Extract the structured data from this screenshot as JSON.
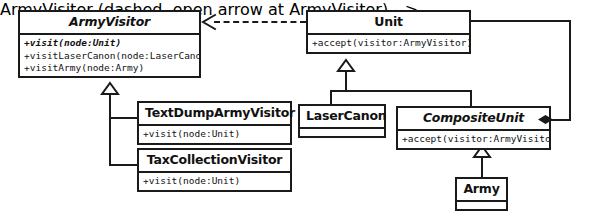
{
  "diagram": {
    "kind": "uml-class-diagram",
    "background_color": "#ffffff",
    "line_color": "#1a1a1a"
  },
  "classes": {
    "army_visitor": {
      "name": "ArmyVisitor",
      "abstract": true,
      "methods": [
        "+visit(node:Unit)",
        "+visitLaserCanon(node:LaserCanon)",
        "+visitArmy(node:Army)"
      ]
    },
    "unit": {
      "name": "Unit",
      "abstract": false,
      "methods": [
        "+accept(visitor:ArmyVisitor)"
      ]
    },
    "text_dump_army_visitor": {
      "name": "TextDumpArmyVisitor",
      "abstract": false,
      "methods": [
        "+visit(node:Unit)"
      ]
    },
    "tax_collection_visitor": {
      "name": "TaxCollectionVisitor",
      "abstract": false,
      "methods": [
        "+visit(node:Unit)"
      ]
    },
    "laser_canon": {
      "name": "LaserCanon",
      "abstract": false,
      "methods": []
    },
    "composite_unit": {
      "name": "CompositeUnit",
      "abstract": true,
      "methods": [
        "+accept(visitor:ArmyVisitor)"
      ]
    },
    "army": {
      "name": "Army",
      "abstract": false,
      "methods": []
    }
  },
  "relationships": [
    {
      "id": "unit-depends-on-armyvisitor",
      "type": "dependency",
      "style": "dashed",
      "arrow": "open",
      "from": "Unit",
      "to": "ArmyVisitor"
    },
    {
      "id": "textdumparmyvisitor-inherits-armyvisitor",
      "type": "generalization",
      "style": "solid",
      "arrow": "hollow-triangle",
      "from": "TextDumpArmyVisitor",
      "to": "ArmyVisitor"
    },
    {
      "id": "taxcollectionvisitor-inherits-armyvisitor",
      "type": "generalization",
      "style": "solid",
      "arrow": "hollow-triangle",
      "from": "TaxCollectionVisitor",
      "to": "ArmyVisitor"
    },
    {
      "id": "lasercanon-inherits-unit",
      "type": "generalization",
      "style": "solid",
      "arrow": "hollow-triangle",
      "from": "LaserCanon",
      "to": "Unit"
    },
    {
      "id": "compositeunit-inherits-unit",
      "type": "generalization",
      "style": "solid",
      "arrow": "hollow-triangle",
      "from": "CompositeUnit",
      "to": "Unit"
    },
    {
      "id": "army-inherits-compositeunit",
      "type": "generalization",
      "style": "solid",
      "arrow": "hollow-triangle",
      "from": "Army",
      "to": "CompositeUnit"
    },
    {
      "id": "compositeunit-composes-unit",
      "type": "composition",
      "style": "solid",
      "arrow": "filled-diamond",
      "from": "CompositeUnit",
      "to": "Unit"
    }
  ]
}
